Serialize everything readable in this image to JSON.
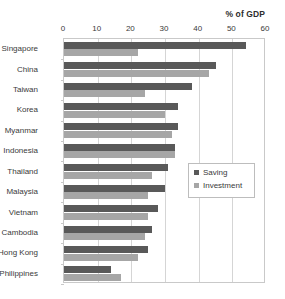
{
  "chart_data": {
    "type": "bar",
    "orientation": "horizontal",
    "title": "",
    "xlabel": "% of GDP",
    "ylabel": "",
    "xlim": [
      0,
      60
    ],
    "xticks": [
      0,
      10,
      20,
      30,
      40,
      50,
      60
    ],
    "grid": true,
    "legend_position": "middle-right",
    "categories": [
      "Singapore",
      "China",
      "Taiwan",
      "Korea",
      "Myanmar",
      "Indonesia",
      "Thailand",
      "Malaysia",
      "Vietnam",
      "Cambodia",
      "Hong Kong",
      "Philippines"
    ],
    "series": [
      {
        "name": "Saving",
        "color": "#595959",
        "values": [
          54,
          45,
          38,
          34,
          34,
          33,
          31,
          30,
          28,
          26,
          25,
          14
        ]
      },
      {
        "name": "Investment",
        "color": "#a6a6a6",
        "values": [
          22,
          43,
          24,
          30,
          32,
          33,
          26,
          25,
          25,
          24,
          22,
          17
        ]
      }
    ]
  },
  "legend": {
    "entries": [
      {
        "label": "Saving"
      },
      {
        "label": "Investment"
      }
    ]
  }
}
